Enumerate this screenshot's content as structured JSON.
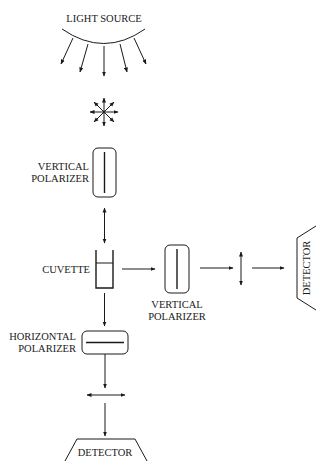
{
  "diagram": {
    "type": "fluorescence-polarization-setup",
    "labels": {
      "light_source": "LIGHT SOURCE",
      "vertical_polarizer_1_line1": "VERTICAL",
      "vertical_polarizer_1_line2": "POLARIZER",
      "cuvette": "CUVETTE",
      "vertical_polarizer_2_line1": "VERTICAL",
      "vertical_polarizer_2_line2": "POLARIZER",
      "horizontal_polarizer_line1": "HORIZONTAL",
      "horizontal_polarizer_line2": "POLARIZER",
      "detector_right": "DETECTOR",
      "detector_bottom": "DETECTOR"
    },
    "nodes": [
      {
        "id": "light-source",
        "label": "LIGHT SOURCE"
      },
      {
        "id": "unpolarized-light",
        "symbol": "starburst"
      },
      {
        "id": "vertical-polarizer-1",
        "label": "VERTICAL POLARIZER",
        "orientation": "vertical"
      },
      {
        "id": "vertical-light-1",
        "symbol": "vertical-double-arrow"
      },
      {
        "id": "cuvette",
        "label": "CUVETTE"
      },
      {
        "id": "vertical-polarizer-2",
        "label": "VERTICAL POLARIZER",
        "orientation": "vertical"
      },
      {
        "id": "vertical-light-2",
        "symbol": "vertical-double-arrow"
      },
      {
        "id": "detector-right",
        "label": "DETECTOR"
      },
      {
        "id": "horizontal-polarizer",
        "label": "HORIZONTAL POLARIZER",
        "orientation": "horizontal"
      },
      {
        "id": "horizontal-light",
        "symbol": "horizontal-double-arrow"
      },
      {
        "id": "detector-bottom",
        "label": "DETECTOR"
      }
    ],
    "edges": [
      [
        "light-source",
        "unpolarized-light"
      ],
      [
        "unpolarized-light",
        "vertical-polarizer-1"
      ],
      [
        "vertical-polarizer-1",
        "cuvette"
      ],
      [
        "cuvette",
        "vertical-polarizer-2"
      ],
      [
        "vertical-polarizer-2",
        "vertical-light-2"
      ],
      [
        "vertical-light-2",
        "detector-right"
      ],
      [
        "cuvette",
        "horizontal-polarizer"
      ],
      [
        "horizontal-polarizer",
        "horizontal-light"
      ],
      [
        "horizontal-light",
        "detector-bottom"
      ]
    ],
    "colors": {
      "ink": "#1a1a1a",
      "background": "#ffffff"
    }
  }
}
